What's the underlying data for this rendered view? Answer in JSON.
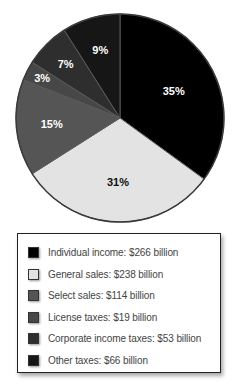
{
  "chart_data": {
    "type": "pie",
    "title": "",
    "start_angle_deg": 0,
    "direction": "clockwise",
    "legend_position": "bottom",
    "slices": [
      {
        "label": "Individual income",
        "value": 266,
        "percent": 35,
        "percent_label": "35%",
        "color": "#000000",
        "text_color": "#ffffff",
        "legend_text": "Individual income: $266 billion"
      },
      {
        "label": "General sales",
        "value": 238,
        "percent": 31,
        "percent_label": "31%",
        "color": "#e3e3e3",
        "text_color": "#111111",
        "legend_text": "General sales: $238 billion"
      },
      {
        "label": "Select sales",
        "value": 114,
        "percent": 15,
        "percent_label": "15%",
        "color": "#555555",
        "text_color": "#ffffff",
        "legend_text": "Select sales: $114 billion"
      },
      {
        "label": "License taxes",
        "value": 19,
        "percent": 3,
        "percent_label": "3%",
        "color": "#474747",
        "text_color": "#ffffff",
        "legend_text": "License taxes: $19 billion"
      },
      {
        "label": "Corporate income taxes",
        "value": 53,
        "percent": 7,
        "percent_label": "7%",
        "color": "#2e2e2e",
        "text_color": "#ffffff",
        "legend_text": "Corporate income taxes: $53 billion"
      },
      {
        "label": "Other taxes",
        "value": 66,
        "percent": 9,
        "percent_label": "9%",
        "color": "#161616",
        "text_color": "#ffffff",
        "legend_text": "Other taxes: $66 billion"
      }
    ],
    "unit": "billion dollars"
  },
  "legend": {
    "items": [
      {
        "label": "Individual income: $266 billion",
        "color": "#000000"
      },
      {
        "label": "General sales: $238 billion",
        "color": "#e3e3e3"
      },
      {
        "label": "Select sales: $114 billion",
        "color": "#555555"
      },
      {
        "label": "License taxes: $19 billion",
        "color": "#474747"
      },
      {
        "label": "Corporate income taxes: $53 billion",
        "color": "#2e2e2e"
      },
      {
        "label": "Other taxes: $66 billion",
        "color": "#161616"
      }
    ]
  }
}
